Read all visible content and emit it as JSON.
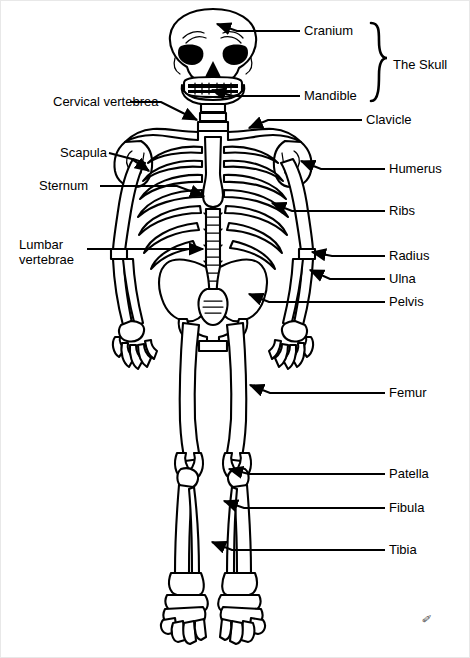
{
  "figure": {
    "background_color": "#ffffff",
    "line_color": "#000000",
    "signature": "✐"
  },
  "group_labels": [
    {
      "id": "the-skull",
      "text": "The Skull",
      "x": 392,
      "y": 57,
      "brace_top": 22,
      "brace_bottom": 100
    }
  ],
  "labels": [
    {
      "id": "cranium",
      "text": "Cranium",
      "side": "right",
      "x": 303,
      "y": 23,
      "lines": 1
    },
    {
      "id": "mandible",
      "text": "Mandible",
      "side": "right",
      "x": 303,
      "y": 88,
      "lines": 1
    },
    {
      "id": "clavicle",
      "text": "Clavicle",
      "side": "right",
      "x": 365,
      "y": 112,
      "lines": 1
    },
    {
      "id": "humerus",
      "text": "Humerus",
      "side": "right",
      "x": 388,
      "y": 161,
      "lines": 1
    },
    {
      "id": "ribs",
      "text": "Ribs",
      "side": "right",
      "x": 388,
      "y": 203,
      "lines": 1
    },
    {
      "id": "radius",
      "text": "Radius",
      "side": "right",
      "x": 388,
      "y": 248,
      "lines": 1
    },
    {
      "id": "ulna",
      "text": "Ulna",
      "side": "right",
      "x": 388,
      "y": 271,
      "lines": 1
    },
    {
      "id": "pelvis",
      "text": "Pelvis",
      "side": "right",
      "x": 388,
      "y": 294,
      "lines": 1
    },
    {
      "id": "femur",
      "text": "Femur",
      "side": "right",
      "x": 388,
      "y": 385,
      "lines": 1
    },
    {
      "id": "patella",
      "text": "Patella",
      "side": "right",
      "x": 388,
      "y": 466,
      "lines": 1
    },
    {
      "id": "fibula",
      "text": "Fibula",
      "side": "right",
      "x": 388,
      "y": 500,
      "lines": 1
    },
    {
      "id": "tibia",
      "text": "Tibia",
      "side": "right",
      "x": 388,
      "y": 542,
      "lines": 1
    },
    {
      "id": "cervical-vertebrea",
      "text": "Cervical vertebrea",
      "side": "left",
      "x": 52,
      "y": 94,
      "lines": 1
    },
    {
      "id": "scapula",
      "text": "Scapula",
      "side": "left",
      "x": 59,
      "y": 145,
      "lines": 1
    },
    {
      "id": "sternum",
      "text": "Sternum",
      "side": "left",
      "x": 38,
      "y": 178,
      "lines": 1
    },
    {
      "id": "lumbar-vertebrae",
      "text": "Lumbar\nvertebrae",
      "side": "left",
      "x": 18,
      "y": 236,
      "lines": 2
    }
  ],
  "leaders": [
    {
      "id": "cranium-leader",
      "target": "cranium",
      "path": "M 299 30 L 236 30 L 216 23"
    },
    {
      "id": "mandible-leader",
      "target": "mandible",
      "path": "M 299 95 L 232 95 L 211 89"
    },
    {
      "id": "clavicle-leader",
      "target": "clavicle",
      "path": "M 361 119 L 267 119 L 248 127"
    },
    {
      "id": "humerus-leader",
      "target": "humerus",
      "path": "M 384 168 L 320 168 L 300 160"
    },
    {
      "id": "ribs-leader",
      "target": "ribs",
      "path": "M 384 210 L 291 210 L 271 202"
    },
    {
      "id": "radius-leader",
      "target": "radius",
      "path": "M 384 255 L 331 255 L 311 251"
    },
    {
      "id": "ulna-leader",
      "target": "ulna",
      "path": "M 384 278 L 329 278 L 309 269"
    },
    {
      "id": "pelvis-leader",
      "target": "pelvis",
      "path": "M 384 301 L 268 301 L 248 293"
    },
    {
      "id": "femur-leader",
      "target": "femur",
      "path": "M 384 392 L 269 392 L 249 384"
    },
    {
      "id": "patella-leader",
      "target": "patella",
      "path": "M 384 473 L 248 473 L 228 468"
    },
    {
      "id": "fibula-leader",
      "target": "fibula",
      "path": "M 384 507 L 243 507 L 223 500"
    },
    {
      "id": "tibia-leader",
      "target": "tibia",
      "path": "M 384 549 L 231 549 L 211 541"
    },
    {
      "id": "cervical-vertebrea-leader",
      "target": "cervical-vertebrea",
      "path": "M 129 101 L 160 101 L 196 119"
    },
    {
      "id": "scapula-leader",
      "target": "scapula",
      "path": "M 108 152 L 131 158 L 148 170"
    },
    {
      "id": "sternum-leader",
      "target": "sternum",
      "path": "M 99 185 L 176 185 L 203 195"
    },
    {
      "id": "lumbar-vertebrae-leader",
      "target": "lumbar-vertebrae",
      "path": "M 86 248 L 160 248 L 202 248"
    }
  ],
  "bone_parts": [
    "cranium",
    "mandible",
    "cervical-vertebrae",
    "clavicle",
    "scapula",
    "sternum",
    "ribs",
    "thoracic-spine",
    "lumbar-vertebrae",
    "pelvis",
    "humerus",
    "radius",
    "ulna",
    "carpals",
    "femur",
    "patella",
    "tibia",
    "fibula",
    "tarsals"
  ]
}
